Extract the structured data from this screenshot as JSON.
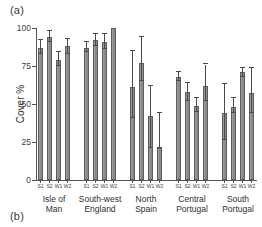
{
  "figure": {
    "panel_a_label": "(a)",
    "panel_b_label": "(b)"
  },
  "chart_data": {
    "type": "bar",
    "title": "",
    "xlabel": "",
    "ylabel": "Cover %",
    "ylim": [
      0,
      100
    ],
    "yticks": [
      0,
      25,
      50,
      75,
      100
    ],
    "ytick_labels": [
      "0",
      "25",
      "50",
      "75",
      "100"
    ],
    "grid": false,
    "legend": "none",
    "error_bars": "standard error / confidence interval (vertical whiskers with caps)",
    "bar_color": "#8e8e8e",
    "bar_edge_color": "#5d5d5d",
    "error_bar_color": "#4a4a4a",
    "categories": [
      "S1",
      "S2",
      "W1",
      "W2"
    ],
    "groups": [
      {
        "name": "Isle of Man",
        "label_lines": [
          "Isle of",
          "Man"
        ],
        "points": [
          {
            "tick": "S1",
            "value": 87,
            "err_low": 83,
            "err_high": 92
          },
          {
            "tick": "S2",
            "value": 94,
            "err_low": 91,
            "err_high": 98
          },
          {
            "tick": "W1",
            "value": 79,
            "err_low": 75,
            "err_high": 84
          },
          {
            "tick": "W2",
            "value": 88,
            "err_low": 83,
            "err_high": 93
          }
        ]
      },
      {
        "name": "South-west England",
        "label_lines": [
          "South-west",
          "England"
        ],
        "points": [
          {
            "tick": "S1",
            "value": 87,
            "err_low": 84,
            "err_high": 91
          },
          {
            "tick": "S2",
            "value": 92,
            "err_low": 88,
            "err_high": 96
          },
          {
            "tick": "W1",
            "value": 91,
            "err_low": 86,
            "err_high": 96
          },
          {
            "tick": "W2",
            "value": 100,
            "err_low": 100,
            "err_high": 100
          }
        ]
      },
      {
        "name": "North Spain",
        "label_lines": [
          "North",
          "Spain"
        ],
        "points": [
          {
            "tick": "S1",
            "value": 61,
            "err_low": 41,
            "err_high": 85
          },
          {
            "tick": "S2",
            "value": 77,
            "err_low": 65,
            "err_high": 94
          },
          {
            "tick": "W1",
            "value": 42,
            "err_low": 21,
            "err_high": 62
          },
          {
            "tick": "W2",
            "value": 21,
            "err_low": 21,
            "err_high": 44
          }
        ]
      },
      {
        "name": "Central Portugal",
        "label_lines": [
          "Central",
          "Portugal"
        ],
        "points": [
          {
            "tick": "S1",
            "value": 68,
            "err_low": 65,
            "err_high": 71
          },
          {
            "tick": "S2",
            "value": 58,
            "err_low": 52,
            "err_high": 64
          },
          {
            "tick": "W1",
            "value": 49,
            "err_low": 45,
            "err_high": 54
          },
          {
            "tick": "W2",
            "value": 62,
            "err_low": 52,
            "err_high": 76
          }
        ]
      },
      {
        "name": "South Portugal",
        "label_lines": [
          "South",
          "Portugal"
        ],
        "points": [
          {
            "tick": "S1",
            "value": 44,
            "err_low": 26,
            "err_high": 63
          },
          {
            "tick": "S2",
            "value": 48,
            "err_low": 44,
            "err_high": 54
          },
          {
            "tick": "W1",
            "value": 71,
            "err_low": 68,
            "err_high": 74
          },
          {
            "tick": "W2",
            "value": 57,
            "err_low": 44,
            "err_high": 74
          }
        ]
      }
    ]
  }
}
